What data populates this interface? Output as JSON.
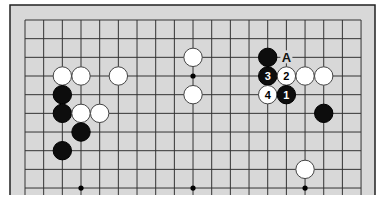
{
  "diagram": {
    "type": "go-board-fragment",
    "columns": 19,
    "rows_visible": 10,
    "colors": {
      "board": "#d8d8d8",
      "line": "#333333",
      "black_stone": "#0d0d0d",
      "white_stone": "#ffffff",
      "border": "#222222",
      "label": "#111111"
    },
    "star_points": [
      {
        "col": 9,
        "row": 3
      },
      {
        "col": 3,
        "row": 9
      },
      {
        "col": 9,
        "row": 9
      },
      {
        "col": 15,
        "row": 9
      }
    ],
    "stones": [
      {
        "color": "white",
        "col": 2,
        "row": 3,
        "label": ""
      },
      {
        "color": "white",
        "col": 3,
        "row": 3,
        "label": ""
      },
      {
        "color": "white",
        "col": 5,
        "row": 3,
        "label": ""
      },
      {
        "color": "black",
        "col": 2,
        "row": 4,
        "label": ""
      },
      {
        "color": "black",
        "col": 2,
        "row": 5,
        "label": ""
      },
      {
        "color": "white",
        "col": 3,
        "row": 5,
        "label": ""
      },
      {
        "color": "white",
        "col": 4,
        "row": 5,
        "label": ""
      },
      {
        "color": "black",
        "col": 3,
        "row": 6,
        "label": ""
      },
      {
        "color": "black",
        "col": 2,
        "row": 7,
        "label": ""
      },
      {
        "color": "white",
        "col": 9,
        "row": 2,
        "label": ""
      },
      {
        "color": "white",
        "col": 9,
        "row": 4,
        "label": ""
      },
      {
        "color": "black",
        "col": 13,
        "row": 2,
        "label": ""
      },
      {
        "color": "black",
        "col": 13,
        "row": 3,
        "label": "3"
      },
      {
        "color": "white",
        "col": 14,
        "row": 3,
        "label": "2"
      },
      {
        "color": "white",
        "col": 15,
        "row": 3,
        "label": ""
      },
      {
        "color": "white",
        "col": 16,
        "row": 3,
        "label": ""
      },
      {
        "color": "white",
        "col": 13,
        "row": 4,
        "label": "4"
      },
      {
        "color": "black",
        "col": 14,
        "row": 4,
        "label": "1"
      },
      {
        "color": "black",
        "col": 16,
        "row": 5,
        "label": ""
      },
      {
        "color": "white",
        "col": 15,
        "row": 8,
        "label": ""
      }
    ],
    "markers": [
      {
        "text": "A",
        "col": 14,
        "row": 2
      }
    ]
  }
}
